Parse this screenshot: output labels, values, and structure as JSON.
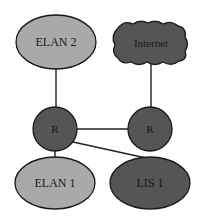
{
  "diagram": {
    "title": "",
    "colors": {
      "light_node": "#a9a9a9",
      "dark_node": "#555555",
      "stroke": "#1a1a1a",
      "background": "#ffffff"
    },
    "nodes": [
      {
        "id": "elan2",
        "label": "ELAN 2",
        "shape": "ellipse",
        "fill": "light"
      },
      {
        "id": "internet",
        "label": "Internet",
        "shape": "cloud",
        "fill": "dark"
      },
      {
        "id": "router_left",
        "label": "R",
        "shape": "circle",
        "fill": "dark"
      },
      {
        "id": "router_right",
        "label": "R",
        "shape": "circle",
        "fill": "dark"
      },
      {
        "id": "elan1",
        "label": "ELAN 1",
        "shape": "ellipse",
        "fill": "light"
      },
      {
        "id": "lis1",
        "label": "LIS 1",
        "shape": "ellipse",
        "fill": "dark"
      }
    ],
    "edges": [
      {
        "from": "elan2",
        "to": "router_left"
      },
      {
        "from": "internet",
        "to": "router_right"
      },
      {
        "from": "router_left",
        "to": "router_right"
      },
      {
        "from": "router_left",
        "to": "elan1"
      },
      {
        "from": "router_left",
        "to": "lis1"
      }
    ]
  }
}
